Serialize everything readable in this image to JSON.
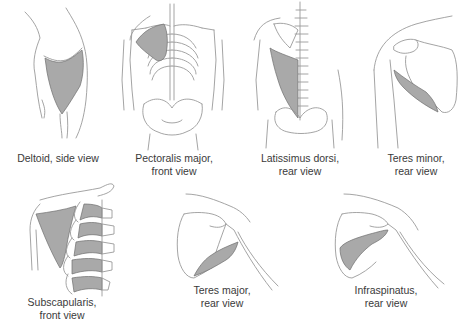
{
  "figure": {
    "colors": {
      "muscle_fill": "#a9a9a9",
      "outline": "#9a9a9a",
      "caption_text": "#3a3a3a",
      "background": "#ffffff"
    },
    "panels": [
      {
        "id": "deltoid",
        "muscle": "Deltoid",
        "line1": "Deltoid, side view",
        "line2": ""
      },
      {
        "id": "pectoralis-major",
        "muscle": "Pectoralis major",
        "line1": "Pectoralis major,",
        "line2": "front view"
      },
      {
        "id": "latissimus-dorsi",
        "muscle": "Latissimus dorsi",
        "line1": "Latissimus dorsi,",
        "line2": "rear view"
      },
      {
        "id": "teres-minor",
        "muscle": "Teres minor",
        "line1": "Teres minor,",
        "line2": "rear view"
      },
      {
        "id": "subscapularis",
        "muscle": "Subscapularis",
        "line1": "Subscapularis,",
        "line2": "front view"
      },
      {
        "id": "teres-major",
        "muscle": "Teres major",
        "line1": "Teres major,",
        "line2": "rear view"
      },
      {
        "id": "infraspinatus",
        "muscle": "Infraspinatus",
        "line1": "Infraspinatus,",
        "line2": "rear view"
      }
    ]
  }
}
